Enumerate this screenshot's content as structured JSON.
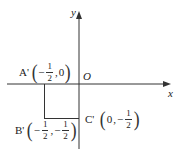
{
  "diagram": {
    "type": "coordinate-plane",
    "axes": {
      "x_label": "x",
      "y_label": "y",
      "origin_label": "O"
    },
    "points": [
      {
        "name": "A'",
        "x": "-1/2",
        "y": "0",
        "x_num": "1",
        "x_den": "2",
        "x_sign": "−",
        "y_val": "0"
      },
      {
        "name": "B'",
        "x": "-1/2",
        "y": "-1/2",
        "x_num": "1",
        "x_den": "2",
        "x_sign": "−",
        "y_num": "1",
        "y_den": "2",
        "y_sign": "−"
      },
      {
        "name": "C'",
        "x": "0",
        "y": "-1/2",
        "x_val": "0",
        "y_num": "1",
        "y_den": "2",
        "y_sign": "−"
      }
    ],
    "segments": [
      {
        "from": "A'",
        "to": "B'"
      },
      {
        "from": "B'",
        "to": "C'"
      }
    ],
    "colors": {
      "line": "#333333",
      "background": "#ffffff"
    }
  }
}
